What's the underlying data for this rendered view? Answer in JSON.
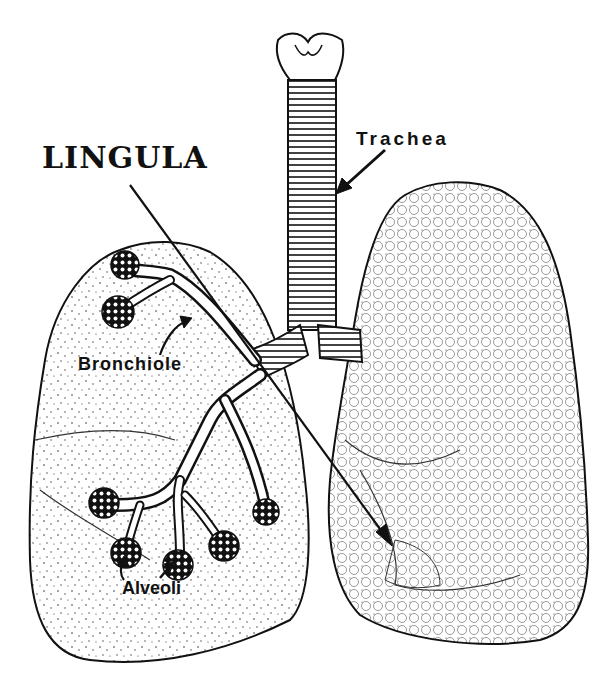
{
  "figure": {
    "type": "anatomical-illustration",
    "colors": {
      "ink": "#111111",
      "background": "#ffffff"
    }
  },
  "labels": {
    "lingula": "LINGULA",
    "trachea": "Trachea",
    "bronchiole": "Bronchiole",
    "alveoli": "Alveoli"
  },
  "structures": [
    "larynx",
    "trachea",
    "left-bronchus",
    "right-bronchus",
    "bronchiole-tree",
    "alveoli-clusters",
    "right-lung",
    "left-lung",
    "lingula"
  ]
}
